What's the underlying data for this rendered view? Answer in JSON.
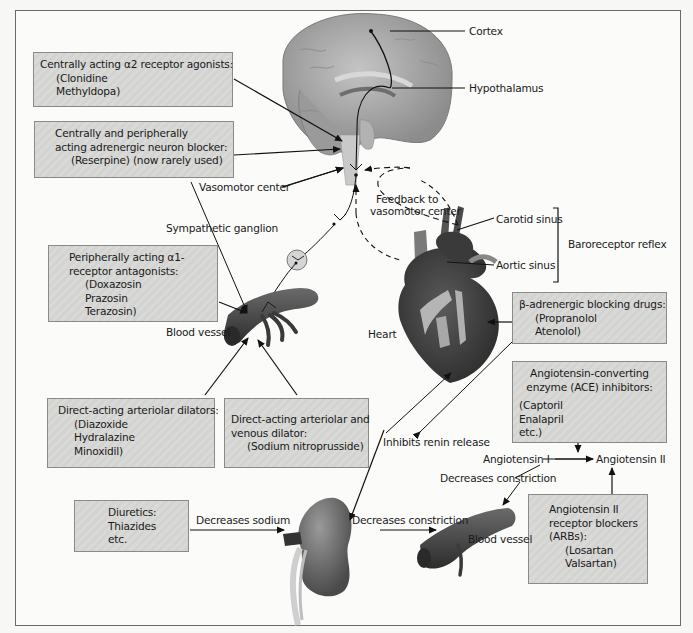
{
  "figure": {
    "organs": {
      "brain": "Brain",
      "heart_label": "Heart",
      "kidney": "Kidney",
      "blood_vessel_upper_label": "Blood vessel",
      "blood_vessel_lower_label": "Blood vessel"
    },
    "labels": {
      "cortex": "Cortex",
      "hypothalamus": "Hypothalamus",
      "vasomotor_center": "Vasomotor center",
      "sympathetic_ganglion": "Sympathetic ganglion",
      "feedback_line1": "Feedback to",
      "feedback_line2": "vasomotor center",
      "carotid_sinus": "Carotid sinus",
      "aortic_sinus": "Aortic sinus",
      "baroreceptor_reflex": "Baroreceptor reflex",
      "inhibits_renin_release": "Inhibits renin release",
      "angiotensin_1": "Angiotensin I",
      "angiotensin_2": "Angiotensin II",
      "decreases_constriction_upper": "Decreases constriction",
      "decreases_constriction_lower": "Decreases constriction",
      "decreases_sodium": "Decreases sodium"
    },
    "drug_boxes": {
      "alpha2_agonists": {
        "title": "Centrally acting α2 receptor agonists:",
        "drugs": [
          "(Clonidine",
          "Methyldopa)"
        ]
      },
      "neuron_blocker": {
        "title_line1": "Centrally and peripherally",
        "title_line2": "acting adrenergic neuron blocker:",
        "drugs": [
          "(Reserpine) (now rarely used)"
        ]
      },
      "alpha1_antagonists": {
        "title_line1": "Peripherally acting α1-",
        "title_line2": "receptor antagonists:",
        "drugs": [
          "(Doxazosin",
          "Prazosin",
          "Terazosin)"
        ]
      },
      "arteriolar_dilators": {
        "title": "Direct-acting arteriolar dilators:",
        "drugs": [
          "(Diazoxide",
          "Hydralazine",
          "Minoxidil)"
        ]
      },
      "arteriolar_venous_dilator": {
        "title_line1": "Direct-acting arteriolar and",
        "title_line2": "venous dilator:",
        "drugs": [
          "(Sodium nitroprusside)"
        ]
      },
      "beta_blockers": {
        "title": "β-adrenergic blocking drugs:",
        "drugs": [
          "(Propranolol",
          "Atenolol)"
        ]
      },
      "ace_inhibitors": {
        "title_line1": "Angiotensin-converting",
        "title_line2": "enzyme (ACE) inhibitors:",
        "drugs": [
          "(Captoril",
          "Enalapril",
          "etc.)"
        ]
      },
      "diuretics": {
        "title": "Diuretics:",
        "drugs": [
          "Thiazides",
          "etc."
        ]
      },
      "arbs": {
        "title_line1": "Angiotensin II",
        "title_line2": "receptor blockers",
        "title_line3": "(ARBs):",
        "drugs": [
          "(Losartan",
          "Valsartan)"
        ]
      }
    },
    "colors": {
      "box_fill": "#d6d6d4",
      "box_border": "#8a8a8a",
      "organ_dark": "#3c3c3c",
      "organ_mid": "#6e6e6e",
      "brain_fill": "#a9a9a9",
      "line": "#111111"
    }
  }
}
